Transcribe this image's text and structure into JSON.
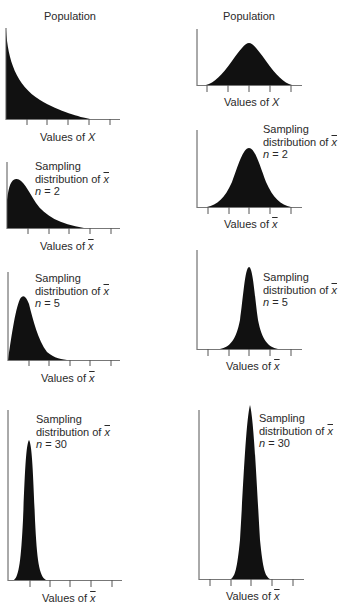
{
  "figure": {
    "left_column": {
      "population": {
        "title": "Population",
        "axis_label_prefix": "Values of ",
        "axis_var": "X",
        "shape": "exponential (right-skewed)"
      },
      "n2": {
        "line1": "Sampling",
        "line2_prefix": "distribution of ",
        "line2_var": "x",
        "line3_prefix": "n",
        "line3_value": " = 2",
        "axis_label_prefix": "Values of ",
        "axis_var": "x"
      },
      "n5": {
        "line1": "Sampling",
        "line2_prefix": "distribution of ",
        "line2_var": "x",
        "line3_prefix": "n",
        "line3_value": " = 5",
        "axis_label_prefix": "Values of ",
        "axis_var": "x"
      },
      "n30": {
        "line1": "Sampling",
        "line2_prefix": "distribution of ",
        "line2_var": "x",
        "line3_prefix": "n",
        "line3_value": " = 30",
        "axis_label_prefix": "Values of ",
        "axis_var": "x"
      }
    },
    "right_column": {
      "population": {
        "title": "Population",
        "axis_label_prefix": "Values of ",
        "axis_var": "X",
        "shape": "normal"
      },
      "n2": {
        "line1": "Sampling",
        "line2_prefix": "distribution of ",
        "line2_var": "x",
        "line3_prefix": "n",
        "line3_value": " = 2",
        "axis_label_prefix": "Values of ",
        "axis_var": "x"
      },
      "n5": {
        "line1": "Sampling",
        "line2_prefix": "distribution of ",
        "line2_var": "x",
        "line3_prefix": "n",
        "line3_value": " = 5",
        "axis_label_prefix": "Values of ",
        "axis_var": "x"
      },
      "n30": {
        "line1": "Sampling",
        "line2_prefix": "distribution of ",
        "line2_var": "x",
        "line3_prefix": "n",
        "line3_value": " = 30",
        "axis_label_prefix": "Values of ",
        "axis_var": "x"
      }
    },
    "colors": {
      "fill": "#111111",
      "axis": "#555555",
      "text": "#2a2a2a"
    }
  }
}
